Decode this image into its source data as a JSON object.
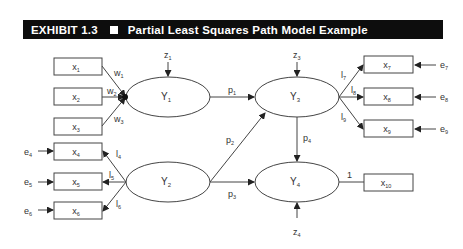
{
  "header": {
    "exhibit": "EXHIBIT 1.3",
    "title": "Partial Least Squares Path Model Example"
  },
  "latent": {
    "Y1": {
      "label": "Y",
      "sub": "1"
    },
    "Y2": {
      "label": "Y",
      "sub": "2"
    },
    "Y3": {
      "label": "Y",
      "sub": "3"
    },
    "Y4": {
      "label": "Y",
      "sub": "4"
    }
  },
  "indicators": [
    {
      "label": "x",
      "sub": "1"
    },
    {
      "label": "x",
      "sub": "2"
    },
    {
      "label": "x",
      "sub": "3"
    },
    {
      "label": "x",
      "sub": "4"
    },
    {
      "label": "x",
      "sub": "5"
    },
    {
      "label": "x",
      "sub": "6"
    },
    {
      "label": "x",
      "sub": "7"
    },
    {
      "label": "x",
      "sub": "8"
    },
    {
      "label": "x",
      "sub": "9"
    },
    {
      "label": "x",
      "sub": "10"
    }
  ],
  "weights": [
    {
      "l": "w",
      "s": "1"
    },
    {
      "l": "w",
      "s": "2"
    },
    {
      "l": "w",
      "s": "3"
    }
  ],
  "loadings": [
    {
      "l": "l",
      "s": "4"
    },
    {
      "l": "l",
      "s": "5"
    },
    {
      "l": "l",
      "s": "6"
    },
    {
      "l": "l",
      "s": "7"
    },
    {
      "l": "l",
      "s": "8"
    },
    {
      "l": "l",
      "s": "9"
    }
  ],
  "paths": [
    {
      "l": "p",
      "s": "1"
    },
    {
      "l": "p",
      "s": "2"
    },
    {
      "l": "p",
      "s": "3"
    },
    {
      "l": "p",
      "s": "4"
    }
  ],
  "errors": [
    {
      "l": "e",
      "s": "4"
    },
    {
      "l": "e",
      "s": "5"
    },
    {
      "l": "e",
      "s": "6"
    },
    {
      "l": "e",
      "s": "7"
    },
    {
      "l": "e",
      "s": "8"
    },
    {
      "l": "e",
      "s": "9"
    }
  ],
  "disturbances": [
    {
      "l": "z",
      "s": "1"
    },
    {
      "l": "z",
      "s": "3"
    },
    {
      "l": "z",
      "s": "4"
    }
  ],
  "single_loading": "1"
}
